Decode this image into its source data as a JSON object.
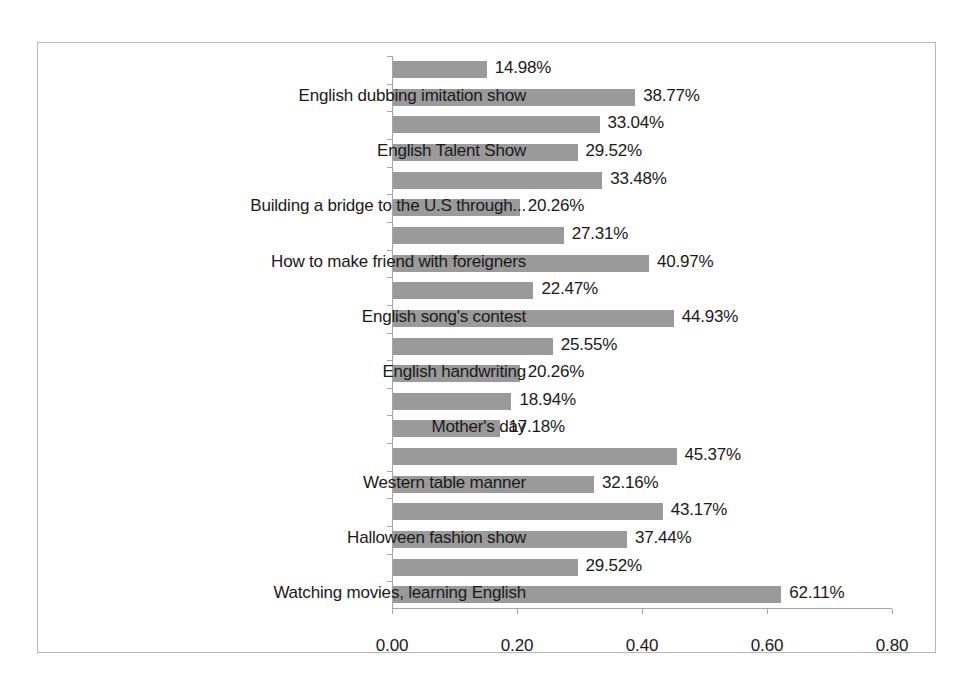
{
  "chart_data": {
    "type": "bar",
    "orientation": "horizontal",
    "title": "",
    "xlabel": "",
    "ylabel": "",
    "xlim": [
      0,
      0.8
    ],
    "xticks": [
      "0.00",
      "0.20",
      "0.40",
      "0.60",
      "0.80"
    ],
    "xtick_values": [
      0.0,
      0.2,
      0.4,
      0.6,
      0.8
    ],
    "grid": false,
    "legend": "none",
    "bar_color": "#9a9a9a",
    "axis_color": "#a6a6a6",
    "frame_color": "#b9b9b9",
    "categories": [
      "",
      "English dubbing imitation show",
      "",
      "English Talent Show",
      "",
      "Building a bridge to the U.S through...",
      "",
      "How to make friend with foreigners",
      "",
      "English song's contest",
      "",
      "English handwriting",
      "",
      "Mother's day",
      "",
      "Western table manner",
      "",
      "Halloween fashion show",
      "",
      "Watching movies, learning English"
    ],
    "values": [
      0.1498,
      0.3877,
      0.3304,
      0.2952,
      0.3348,
      0.2026,
      0.2731,
      0.4097,
      0.2247,
      0.4493,
      0.2555,
      0.2026,
      0.1894,
      0.1718,
      0.4537,
      0.3216,
      0.4317,
      0.3744,
      0.2952,
      0.6211
    ],
    "data_labels": [
      "14.98%",
      "38.77%",
      "33.04%",
      "29.52%",
      "33.48%",
      "20.26%",
      "27.31%",
      "40.97%",
      "22.47%",
      "44.93%",
      "25.55%",
      "20.26%",
      "18.94%",
      "17.18%",
      "45.37%",
      "32.16%",
      "43.17%",
      "37.44%",
      "29.52%",
      "62.11%"
    ]
  }
}
